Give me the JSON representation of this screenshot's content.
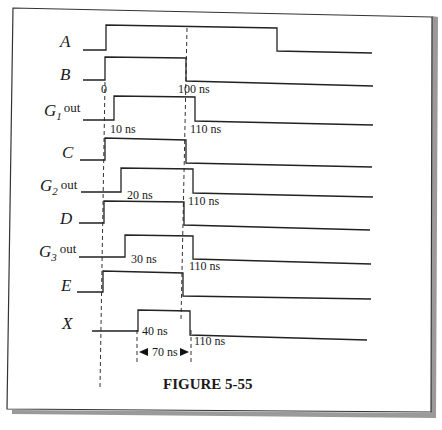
{
  "figure": {
    "caption": "FIGURE 5-55",
    "time_markers": {
      "start": "0",
      "end": "100 ns"
    },
    "signals": [
      {
        "name": "A",
        "label": "A",
        "subscript": "",
        "suffix": "",
        "rise_ns": 0,
        "fall_ns": 215,
        "rise_label": "",
        "fall_label": ""
      },
      {
        "name": "B",
        "label": "B",
        "subscript": "",
        "suffix": "",
        "rise_ns": 0,
        "fall_ns": 100,
        "rise_label": "0",
        "fall_label": "100 ns"
      },
      {
        "name": "G1 out",
        "label": "G",
        "subscript": "1",
        "suffix": "out",
        "rise_ns": 10,
        "fall_ns": 110,
        "rise_label": "10 ns",
        "fall_label": "110 ns"
      },
      {
        "name": "C",
        "label": "C",
        "subscript": "",
        "suffix": "",
        "rise_ns": 0,
        "fall_ns": 100,
        "rise_label": "",
        "fall_label": ""
      },
      {
        "name": "G2 out",
        "label": "G",
        "subscript": "2",
        "suffix": "out",
        "rise_ns": 20,
        "fall_ns": 110,
        "rise_label": "20 ns",
        "fall_label": "110 ns"
      },
      {
        "name": "D",
        "label": "D",
        "subscript": "",
        "suffix": "",
        "rise_ns": 0,
        "fall_ns": 100,
        "rise_label": "",
        "fall_label": ""
      },
      {
        "name": "G3 out",
        "label": "G",
        "subscript": "3",
        "suffix": "out",
        "rise_ns": 30,
        "fall_ns": 110,
        "rise_label": "30 ns",
        "fall_label": "110 ns"
      },
      {
        "name": "E",
        "label": "E",
        "subscript": "",
        "suffix": "",
        "rise_ns": 0,
        "fall_ns": 100,
        "rise_label": "",
        "fall_label": ""
      },
      {
        "name": "X",
        "label": "X",
        "subscript": "",
        "suffix": "",
        "rise_ns": 40,
        "fall_ns": 110,
        "rise_label": "40 ns",
        "fall_label": "110 ns"
      }
    ],
    "pulse_width_annotation": "70 ns",
    "colors": {
      "ink": "#222222",
      "paper": "#ffffff",
      "shadow": "#9a9a9a"
    }
  }
}
